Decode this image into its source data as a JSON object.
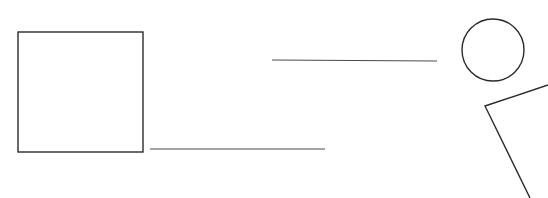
{
  "canvas": {
    "width": 548,
    "height": 198,
    "background_color": "#ffffff",
    "title": "Line drawing sketch",
    "description": "Black-and-white line sketch on a plain white background containing an open square outline, two horizontal rules, a circle outline, and an open V-shaped chevron."
  },
  "style": {
    "stroke_color": "#2b2b2b",
    "hairline_color": "#4a4a4a",
    "shape_stroke_width": 1.4,
    "line_stroke_width": 1
  },
  "shapes": [
    {
      "id": "square",
      "name": "square-outline",
      "type": "rect",
      "label": "Square",
      "x": 18,
      "y": 32,
      "width": 125,
      "height": 120,
      "stroke_width": 1.4,
      "fill": "none"
    },
    {
      "id": "circle",
      "name": "circle-outline",
      "type": "circle",
      "label": "Circle",
      "cx": 493,
      "cy": 50,
      "r": 31,
      "stroke_width": 1.4,
      "fill": "none"
    },
    {
      "id": "upper-line",
      "name": "upper-horizontal-line",
      "type": "line",
      "label": "Upper horizontal line",
      "x1": 272,
      "y1": 60,
      "x2": 437,
      "y2": 61,
      "stroke_width": 1
    },
    {
      "id": "lower-line",
      "name": "lower-horizontal-line",
      "type": "line",
      "label": "Lower horizontal line",
      "x1": 150,
      "y1": 149,
      "x2": 325,
      "y2": 149,
      "stroke_width": 1
    },
    {
      "id": "chevron",
      "name": "v-chevron",
      "type": "polyline",
      "label": "V chevron",
      "points": "548,85 485,106 530,198",
      "stroke_width": 1.4,
      "fill": "none"
    }
  ]
}
